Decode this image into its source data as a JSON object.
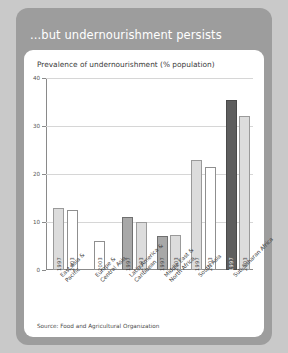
{
  "card": {
    "title": "...but undernourishment persists",
    "subtitle": "Prevalence of undernourishment (% population)",
    "source": "Source: Food and Agricultural Organization"
  },
  "colors": {
    "card_background": "#9d9d9d",
    "panel_background": "#ffffff",
    "page_background": "#c9c9c9",
    "bar_1997_dark": "#5e5e5e",
    "bar_1997_light": "#c9c9c9",
    "bar_2003_light": "#dcdcdc",
    "bar_2003_white": "#ffffff",
    "axis": "#8a8a8a",
    "gridline": "#d6d6d6"
  },
  "chart_data": {
    "type": "bar",
    "title": "Prevalence of undernourishment (% population)",
    "xlabel": "",
    "ylabel": "",
    "ylim": [
      0,
      40
    ],
    "yticks": [
      0,
      10,
      20,
      30,
      40
    ],
    "grid": true,
    "legend": "none",
    "categories": [
      "East Asia &\nPacific",
      "Europe &\nCentral Asia",
      "Latin America &\nCaribbean",
      "Middle East &\nNorth Africa",
      "South Asia",
      "Sub-Saharan Africa"
    ],
    "series": [
      {
        "name": "1997",
        "values": [
          13.0,
          null,
          11.0,
          7.0,
          23.0,
          35.5
        ]
      },
      {
        "name": "2003",
        "values": [
          12.5,
          6.0,
          10.0,
          7.3,
          21.5,
          32.0
        ]
      }
    ],
    "bars": [
      {
        "category": "East Asia &\nPacific",
        "year": "1997",
        "value": 13.0,
        "style": "light"
      },
      {
        "category": "East Asia &\nPacific",
        "year": "2003",
        "value": 12.5,
        "style": "white"
      },
      {
        "category": "Europe &\nCentral Asia",
        "year": "2003",
        "value": 6.0,
        "style": "white"
      },
      {
        "category": "Latin America &\nCaribbean",
        "year": "1997",
        "value": 11.0,
        "style": "mid"
      },
      {
        "category": "Latin America &\nCaribbean",
        "year": "2003",
        "value": 10.0,
        "style": "light"
      },
      {
        "category": "Middle East &\nNorth Africa",
        "year": "1997",
        "value": 7.0,
        "style": "mid"
      },
      {
        "category": "Middle East &\nNorth Africa",
        "year": "2003",
        "value": 7.3,
        "style": "light"
      },
      {
        "category": "South Asia",
        "year": "1997",
        "value": 23.0,
        "style": "light"
      },
      {
        "category": "South Asia",
        "year": "2003",
        "value": 21.5,
        "style": "white"
      },
      {
        "category": "Sub-Saharan Africa",
        "year": "1997",
        "value": 35.5,
        "style": "dark"
      },
      {
        "category": "Sub-Saharan Africa",
        "year": "2003",
        "value": 32.0,
        "style": "light"
      }
    ]
  }
}
